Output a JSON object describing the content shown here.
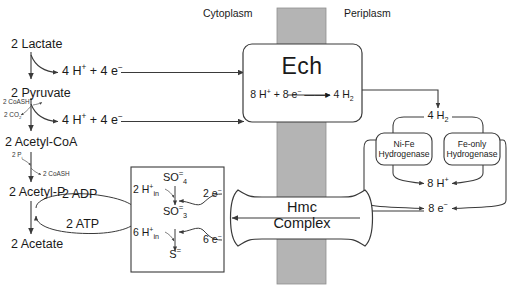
{
  "diagram": {
    "compartments": {
      "left_label": "Cytoplasm",
      "right_label": "Periplasm",
      "membrane_color": "#b4b4b4"
    },
    "colors": {
      "stroke": "#3a3a3a",
      "text": "#1a1a1a",
      "box_fill": "#ffffff",
      "background": "#ffffff"
    },
    "cytoplasm_pathway": {
      "metabolites": [
        {
          "label": "2 Lactate"
        },
        {
          "label": "2 Pyruvate"
        },
        {
          "label": "2 Acetyl-CoA"
        },
        {
          "label": "2 Acetyl-P"
        },
        {
          "label": "2 Acetate"
        }
      ],
      "branch_products": [
        {
          "label_html": "4 H<sup>+</sup> + 4 e<sup>−</sup>",
          "from": "2 Lactate"
        },
        {
          "label_html": "4 H<sup>+</sup> + 4 e<sup>−</sup>",
          "from": "2 Pyruvate"
        }
      ],
      "cofactors": [
        {
          "label": "2 CoASH",
          "role": "input",
          "step": "pyruvate-to-acetyl-CoA"
        },
        {
          "label_html": "2 CO<sub>2</sub>",
          "role": "output",
          "step": "pyruvate-to-acetyl-CoA"
        },
        {
          "label_html": "2 P<sub>i</sub>",
          "role": "input",
          "step": "acetyl-CoA-to-acetyl-P"
        },
        {
          "label": "2 CoASH",
          "role": "output",
          "step": "acetyl-CoA-to-acetyl-P"
        }
      ],
      "energy_cycle": {
        "input": "2 ADP",
        "output": "2 ATP"
      }
    },
    "sulfate_box": {
      "species": [
        {
          "label_html": "SO<span class=\"chg\">=</span><sub>4</sub>",
          "text": "SO4="
        },
        {
          "label_html": "SO<span class=\"chg\">=</span><sub>3</sub>",
          "text": "SO3="
        },
        {
          "label_html": "S<span class=\"chg\">=</span>",
          "text": "S="
        }
      ],
      "proton_inputs": [
        {
          "label_html": "2 H<sup>+</sup><span class=\"inn\">in</span>",
          "text": "2 H+in"
        },
        {
          "label_html": "6 H<sup>+</sup><span class=\"inn\">in</span>",
          "text": "6 H+in"
        }
      ],
      "electron_inputs": [
        {
          "label_html": "2 e<sup>−</sup>",
          "text": "2 e-"
        },
        {
          "label_html": "6 e<sup>−</sup>",
          "text": "6 e-"
        }
      ]
    },
    "membrane_complexes": [
      {
        "name": "Ech",
        "reaction_html": "8 H<sup>+</sup> + 8 e<sup>−</sup> &#8212;&#8212;&#9656; 4 H<sub>2</sub>",
        "reaction_text": "8 H+ + 8 e- -> 4 H2"
      },
      {
        "name_line1": "Hmc",
        "name_line2": "Complex"
      }
    ],
    "periplasm": {
      "hydrogen_label_html": "4 H<sub>2</sub>",
      "hydrogen_text": "4 H2",
      "enzymes": [
        {
          "line1": "Ni-Fe",
          "line2": "Hydrogenase"
        },
        {
          "line1": "Fe-only",
          "line2": "Hydrogenase"
        }
      ],
      "proton_product_html": "8 H<sup>+</sup>",
      "proton_product_text": "8 H+",
      "electron_product_html": "8 e<sup>−</sup>",
      "electron_product_text": "8 e-"
    }
  }
}
